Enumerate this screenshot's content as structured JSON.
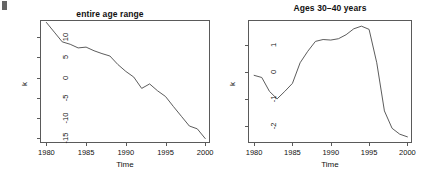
{
  "figure": {
    "width": 440,
    "height": 178,
    "background": "#ffffff",
    "line_color": "#4a4a4a",
    "frame_color": "#5a5a5a",
    "corner_mark": "artifact-mark"
  },
  "chart_data": [
    {
      "type": "line",
      "panel": "left",
      "title": "entire age range",
      "xlabel": "Time",
      "ylabel": "k",
      "xlim": [
        1979.2,
        2000.6
      ],
      "ylim": [
        -16.2,
        14.2
      ],
      "xticks": [
        1980,
        1985,
        1990,
        1995,
        2000
      ],
      "yticks": [
        10,
        5,
        0,
        -5,
        -10,
        -15
      ],
      "grid": false,
      "legend": "none",
      "x": [
        1980,
        1981,
        1982,
        1983,
        1984,
        1985,
        1986,
        1987,
        1988,
        1989,
        1990,
        1991,
        1992,
        1993,
        1994,
        1995,
        1996,
        1997,
        1998,
        1999,
        2000
      ],
      "values": [
        13.6,
        11.2,
        8.8,
        8.2,
        7.3,
        7.5,
        6.6,
        5.9,
        5.3,
        3.2,
        1.5,
        0.1,
        -2.7,
        -1.6,
        -3.3,
        -4.7,
        -7.2,
        -9.6,
        -12.0,
        -12.7,
        -15.1
      ]
    },
    {
      "type": "line",
      "panel": "right",
      "title": "Ages 30–40 years",
      "xlabel": "Time",
      "ylabel": "k",
      "xlim": [
        1979.2,
        2000.6
      ],
      "ylim": [
        -2.65,
        1.95
      ],
      "xticks": [
        1980,
        1985,
        1990,
        1995,
        2000
      ],
      "yticks": [
        1,
        0,
        -1,
        -2
      ],
      "grid": false,
      "legend": "none",
      "x": [
        1980,
        1981,
        1982,
        1983,
        1984,
        1985,
        1986,
        1987,
        1988,
        1989,
        1990,
        1991,
        1992,
        1993,
        1994,
        1995,
        1996,
        1997,
        1998,
        1999,
        2000
      ],
      "values": [
        -0.12,
        -0.2,
        -0.72,
        -1.0,
        -0.72,
        -0.42,
        0.35,
        0.78,
        1.15,
        1.22,
        1.2,
        1.25,
        1.4,
        1.62,
        1.72,
        1.6,
        0.35,
        -1.45,
        -2.1,
        -2.32,
        -2.42
      ]
    }
  ],
  "panels": {
    "left": {
      "title": "entire age range",
      "xlabel": "Time",
      "ylabel": "k",
      "xticks": [
        "1980",
        "1985",
        "1990",
        "1995",
        "2000"
      ],
      "yticks": [
        "10",
        "5",
        "0",
        "-5",
        "-10",
        "-15"
      ]
    },
    "right": {
      "title": "Ages 30–40 years",
      "xlabel": "Time",
      "ylabel": "k",
      "xticks": [
        "1980",
        "1985",
        "1990",
        "1995",
        "2000"
      ],
      "yticks": [
        "1",
        "0",
        "-1",
        "-2"
      ]
    }
  }
}
